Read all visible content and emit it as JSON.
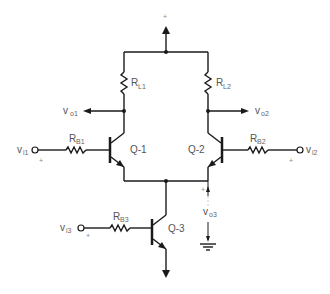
{
  "diagram": {
    "type": "differential-amplifier-circuit",
    "supply_label": "+",
    "resistors": [
      {
        "id": "RL1",
        "main": "R",
        "sub": "L1"
      },
      {
        "id": "RL2",
        "main": "R",
        "sub": "L2"
      },
      {
        "id": "RB1",
        "main": "R",
        "sub": "B1"
      },
      {
        "id": "RB2",
        "main": "R",
        "sub": "B2"
      },
      {
        "id": "RB3",
        "main": "R",
        "sub": "B3"
      }
    ],
    "transistors": [
      {
        "id": "Q1",
        "label": "Q-1"
      },
      {
        "id": "Q2",
        "label": "Q-2"
      },
      {
        "id": "Q3",
        "label": "Q-3"
      }
    ],
    "outputs": [
      {
        "id": "vo1",
        "main": "v",
        "sub": "o1"
      },
      {
        "id": "vo2",
        "main": "v",
        "sub": "o2"
      },
      {
        "id": "vo3",
        "main": "v",
        "sub": "o3"
      }
    ],
    "inputs": [
      {
        "id": "vi1",
        "main": "v",
        "sub": "i1",
        "polarity": "+"
      },
      {
        "id": "vi2",
        "main": "v",
        "sub": "i2",
        "polarity": "+"
      },
      {
        "id": "vi3",
        "main": "v",
        "sub": "i3",
        "polarity": "+"
      }
    ],
    "vo3_polarity": "+"
  }
}
